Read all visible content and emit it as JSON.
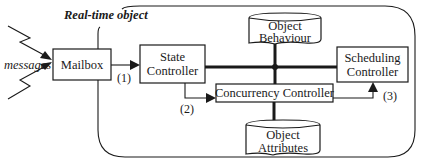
{
  "diagram": {
    "container_label": "Real-time object",
    "external_input_label": "messages",
    "components": {
      "mailbox": "Mailbox",
      "state_controller": [
        "State",
        "Controller"
      ],
      "object_behaviour": [
        "Object",
        "Behaviour"
      ],
      "scheduling_controller": [
        "Scheduling",
        "Controller"
      ],
      "concurrency_controller": "Concurrency Controller",
      "object_attributes": [
        "Object",
        "Attributes"
      ]
    },
    "flow_labels": {
      "step1": "(1)",
      "step2": "(2)",
      "step3": "(3)"
    },
    "connections": [
      {
        "from": "messages",
        "to": "Mailbox",
        "kind": "zigzag-arrow"
      },
      {
        "from": "Mailbox",
        "to": "State Controller",
        "label": "(1)"
      },
      {
        "from": "State Controller",
        "to": "Concurrency Controller",
        "label": "(2)"
      },
      {
        "from": "Concurrency Controller",
        "to": "Scheduling Controller",
        "label": "(3)"
      },
      {
        "from": "State Controller",
        "to": "Scheduling Controller",
        "kind": "bus"
      },
      {
        "from": "Object Behaviour",
        "to": "Concurrency Controller",
        "kind": "bus"
      },
      {
        "from": "Concurrency Controller",
        "to": "Object Attributes",
        "kind": "bus"
      }
    ]
  }
}
